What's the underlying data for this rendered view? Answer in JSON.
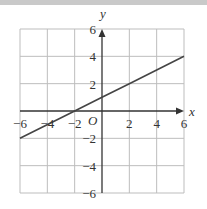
{
  "chart_data": {
    "type": "line",
    "title": "",
    "xlabel": "x",
    "ylabel": "y",
    "origin_label": "O",
    "xlim": [
      -6,
      6
    ],
    "ylim": [
      -6,
      6
    ],
    "grid": true,
    "grid_step": 2,
    "x_ticks": [
      -6,
      -4,
      -2,
      2,
      4,
      6
    ],
    "y_ticks": [
      6,
      4,
      2,
      -2,
      -4,
      -6
    ],
    "x_tick_labels": [
      "−6",
      "−4",
      "−2",
      "2",
      "4",
      "6"
    ],
    "y_tick_labels": [
      "6",
      "4",
      "2",
      "−2",
      "−4",
      "−6"
    ],
    "series": [
      {
        "name": "line",
        "equation": "y = 0.5x + 1",
        "x": [
          -6,
          -2,
          0,
          2,
          6
        ],
        "y": [
          -2,
          0,
          1,
          2,
          4
        ]
      }
    ],
    "colors": {
      "grid": "#bdbdbd",
      "axes": "#333333",
      "line": "#444444"
    }
  }
}
